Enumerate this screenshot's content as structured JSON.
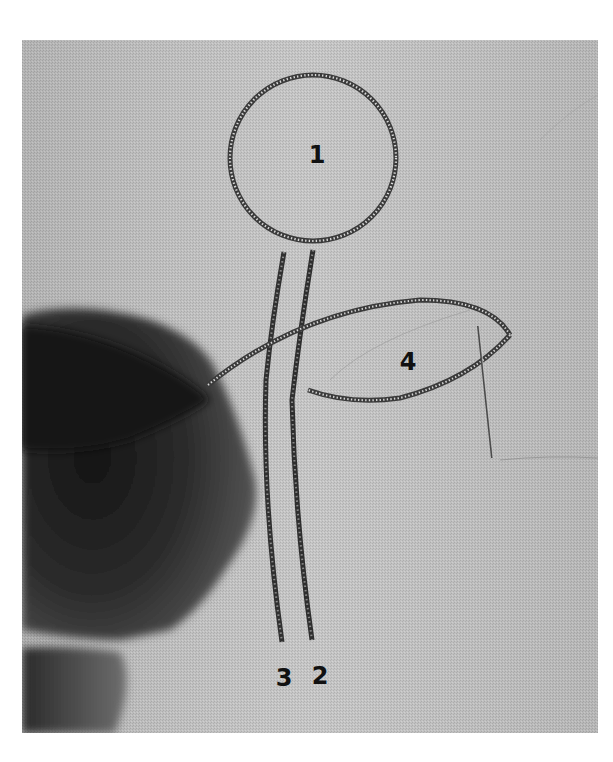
{
  "figure": {
    "background_color": "#ffffff",
    "fabric_color": "#bdbdbd",
    "labels": [
      {
        "id": "1",
        "text": "1",
        "x": 317,
        "y": 155
      },
      {
        "id": "2",
        "text": "2",
        "x": 320,
        "y": 676
      },
      {
        "id": "3",
        "text": "3",
        "x": 284,
        "y": 678
      },
      {
        "id": "4",
        "text": "4",
        "x": 408,
        "y": 362
      }
    ]
  }
}
